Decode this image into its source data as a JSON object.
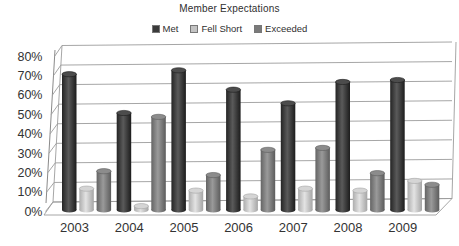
{
  "chart_data": {
    "type": "bar",
    "subtype": "3d-cylinder-column",
    "title": "Member Expectations",
    "categories": [
      "2003",
      "2004",
      "2005",
      "2006",
      "2007",
      "2008",
      "2009"
    ],
    "series": [
      {
        "name": "Met",
        "color": "#3a3a3a",
        "values": [
          70,
          50,
          72,
          62,
          55,
          66,
          67
        ]
      },
      {
        "name": "Fell Short",
        "color": "#c3c3c3",
        "values": [
          11,
          2,
          10,
          7,
          11,
          10,
          15
        ]
      },
      {
        "name": "Exceeded",
        "color": "#7a7a7a",
        "values": [
          20,
          48,
          18,
          31,
          32,
          19,
          13
        ]
      }
    ],
    "xlabel": "",
    "ylabel": "",
    "y_ticks": [
      "0%",
      "10%",
      "20%",
      "30%",
      "40%",
      "50%",
      "60%",
      "70%",
      "80%"
    ],
    "ylim": [
      0,
      80
    ],
    "grid": true,
    "legend_position": "top"
  },
  "colors": {
    "text": "#333333",
    "grid": "#9c9c9c",
    "background": "#ffffff"
  }
}
